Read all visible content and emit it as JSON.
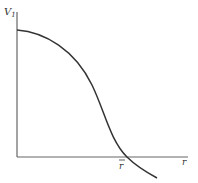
{
  "diagram": {
    "y_axis_label": "V",
    "y_axis_subscript": "1",
    "x_axis_label": "r",
    "crossing_label": "r",
    "crossing_label_has_bar": true,
    "curve_description": "Decreasing S-shaped curve starting at positive V1 on the vertical axis, crossing zero at r-bar and continuing below the horizontal axis",
    "line_color": "#333333"
  }
}
